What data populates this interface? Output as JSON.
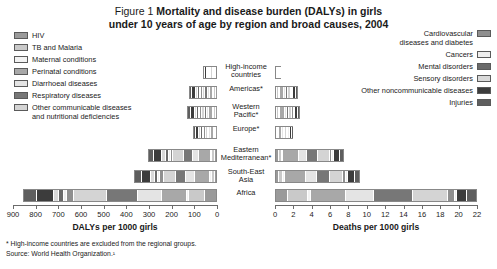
{
  "title": {
    "figure_number": "Figure 1 ",
    "line1": "Mortality and disease burden (DALYs) in girls",
    "line2": "under 10 years of age by region and broad causes, 2004"
  },
  "legend_left": {
    "items": [
      {
        "label": "HIV",
        "color": "#9a9a9a"
      },
      {
        "label": "TB and Malaria",
        "color": "#c9c9c9"
      },
      {
        "label": "Maternal conditions",
        "color": "#f2f2f2"
      },
      {
        "label": "Perinatal conditions",
        "color": "#a8a8a8"
      },
      {
        "label": "Diarrhoeal diseases",
        "color": "#e4e4e4"
      },
      {
        "label": "Respiratory diseases",
        "color": "#777777"
      },
      {
        "label": "Other communicable diseases\nand nutritional deficiencies",
        "color": "#d4d4d4"
      }
    ]
  },
  "legend_right": {
    "items": [
      {
        "label": "Cardiovascular\ndiseases and diabetes",
        "color": "#8f8f8f"
      },
      {
        "label": "Cancers",
        "color": "#efefef"
      },
      {
        "label": "Mental disorders",
        "color": "#6a6a6a"
      },
      {
        "label": "Sensory disorders",
        "color": "#d9d9d9"
      },
      {
        "label": "Other noncommunicable diseases",
        "color": "#3c3c3c"
      },
      {
        "label": "Injuries",
        "color": "#5e5e5e"
      }
    ]
  },
  "regions": [
    "High-income\ncountries",
    "Americas*",
    "Western\nPacific*",
    "Europe*",
    "Eastern\nMediterranean*",
    "South-East\nAsia",
    "Africa"
  ],
  "axes": {
    "left_title": "DALYs per 1000 girls",
    "left_ticks": [
      900,
      800,
      700,
      600,
      500,
      400,
      300,
      200,
      100,
      0
    ],
    "left_max": 900,
    "right_title": "Deaths per 1000 girls",
    "right_ticks": [
      0,
      2,
      4,
      6,
      8,
      10,
      12,
      14,
      16,
      18,
      20,
      22
    ],
    "right_max": 22
  },
  "notes": [
    "* High-income countries are excluded from the regional groups.",
    "Source: World Health Organization.¹"
  ],
  "chart_data": {
    "type": "bar",
    "title": "Mortality and disease burden (DALYs) in girls under 10 years of age by region and broad causes, 2004",
    "orientation": "horizontal-stacked",
    "panels": [
      {
        "name": "left",
        "xlabel": "DALYs per 1000 girls",
        "xlim": [
          900,
          0
        ],
        "direction": "reversed",
        "categories": [
          "High-income countries",
          "Americas*",
          "Western Pacific*",
          "Europe*",
          "Eastern Mediterranean*",
          "South-East Asia",
          "Africa"
        ],
        "series": [
          {
            "name": "HIV",
            "color": "#9a9a9a",
            "values": [
              1,
              4,
              2,
              2,
              6,
              7,
              52
            ]
          },
          {
            "name": "TB and Malaria",
            "color": "#c9c9c9",
            "values": [
              0,
              3,
              3,
              2,
              8,
              10,
              70
            ]
          },
          {
            "name": "Maternal conditions",
            "color": "#f2f2f2",
            "values": [
              0,
              1,
              1,
              1,
              2,
              3,
              5
            ]
          },
          {
            "name": "Perinatal conditions",
            "color": "#a8a8a8",
            "values": [
              8,
              22,
              25,
              18,
              60,
              78,
              115
            ]
          },
          {
            "name": "Diarrhoeal diseases",
            "color": "#e4e4e4",
            "values": [
              1,
              7,
              7,
              4,
              30,
              40,
              112
            ]
          },
          {
            "name": "Respiratory diseases",
            "color": "#777777",
            "values": [
              3,
              11,
              12,
              7,
              42,
              48,
              140
            ]
          },
          {
            "name": "Other communicable diseases and nutritional deficiencies",
            "color": "#d4d4d4",
            "values": [
              5,
              16,
              17,
              12,
              55,
              60,
              155
            ]
          },
          {
            "name": "Cardiovascular diseases and diabetes",
            "color": "#8f8f8f",
            "values": [
              2,
              4,
              5,
              4,
              10,
              12,
              28
            ]
          },
          {
            "name": "Cancers",
            "color": "#efefef",
            "values": [
              2,
              3,
              3,
              3,
              5,
              6,
              10
            ]
          },
          {
            "name": "Mental disorders",
            "color": "#6a6a6a",
            "values": [
              6,
              7,
              7,
              7,
              10,
              11,
              16
            ]
          },
          {
            "name": "Sensory disorders",
            "color": "#d9d9d9",
            "values": [
              7,
              9,
              10,
              9,
              14,
              16,
              22
            ]
          },
          {
            "name": "Other noncommunicable diseases",
            "color": "#3c3c3c",
            "values": [
              18,
              24,
              26,
              24,
              38,
              44,
              72
            ]
          },
          {
            "name": "Injuries",
            "color": "#5e5e5e",
            "values": [
              8,
              14,
              16,
              13,
              25,
              30,
              58
            ]
          }
        ],
        "totals": [
          61,
          125,
          134,
          106,
          305,
          365,
          855
        ]
      },
      {
        "name": "right",
        "xlabel": "Deaths per 1000 girls",
        "xlim": [
          0,
          22
        ],
        "direction": "normal",
        "categories": [
          "High-income countries",
          "Americas*",
          "Western Pacific*",
          "Europe*",
          "Eastern Mediterranean*",
          "South-East Asia",
          "Africa"
        ],
        "series": [
          {
            "name": "HIV",
            "color": "#9a9a9a",
            "values": [
              0.02,
              0.1,
              0.05,
              0.05,
              0.2,
              0.25,
              1.3
            ]
          },
          {
            "name": "TB and Malaria",
            "color": "#c9c9c9",
            "values": [
              0.01,
              0.1,
              0.1,
              0.05,
              0.3,
              0.4,
              2.2
            ]
          },
          {
            "name": "Maternal conditions",
            "color": "#f2f2f2",
            "values": [
              0.0,
              0.02,
              0.02,
              0.02,
              0.05,
              0.08,
              0.15
            ]
          },
          {
            "name": "Perinatal conditions",
            "color": "#a8a8a8",
            "values": [
              0.25,
              0.7,
              0.8,
              0.6,
              2.0,
              2.6,
              4.0
            ]
          },
          {
            "name": "Diarrhoeal diseases",
            "color": "#e4e4e4",
            "values": [
              0.02,
              0.2,
              0.2,
              0.1,
              0.9,
              1.2,
              3.1
            ]
          },
          {
            "name": "Respiratory diseases",
            "color": "#777777",
            "values": [
              0.05,
              0.3,
              0.35,
              0.2,
              1.3,
              1.5,
              4.4
            ]
          },
          {
            "name": "Other communicable diseases and nutritional deficiencies",
            "color": "#d4d4d4",
            "values": [
              0.08,
              0.35,
              0.4,
              0.3,
              1.4,
              1.6,
              4.0
            ]
          },
          {
            "name": "Cardiovascular diseases and diabetes",
            "color": "#8f8f8f",
            "values": [
              0.03,
              0.08,
              0.1,
              0.08,
              0.2,
              0.25,
              0.6
            ]
          },
          {
            "name": "Cancers",
            "color": "#efefef",
            "values": [
              0.04,
              0.06,
              0.07,
              0.06,
              0.1,
              0.12,
              0.2
            ]
          },
          {
            "name": "Mental disorders",
            "color": "#6a6a6a",
            "values": [
              0.0,
              0.0,
              0.0,
              0.0,
              0.0,
              0.0,
              0.0
            ]
          },
          {
            "name": "Sensory disorders",
            "color": "#d9d9d9",
            "values": [
              0.0,
              0.0,
              0.0,
              0.0,
              0.0,
              0.0,
              0.0
            ]
          },
          {
            "name": "Other noncommunicable diseases",
            "color": "#3c3c3c",
            "values": [
              0.12,
              0.3,
              0.35,
              0.3,
              0.6,
              0.7,
              1.0
            ]
          },
          {
            "name": "Injuries",
            "color": "#5e5e5e",
            "values": [
              0.08,
              0.25,
              0.3,
              0.22,
              0.5,
              0.6,
              1.1
            ]
          }
        ],
        "totals": [
          0.7,
          2.46,
          2.74,
          1.98,
          7.55,
          9.3,
          22.05
        ]
      }
    ]
  }
}
